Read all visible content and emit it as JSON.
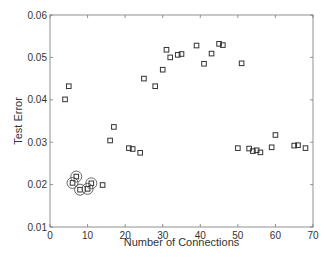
{
  "chart_data": {
    "type": "scatter",
    "title": "",
    "xlabel": "Number of Connections",
    "ylabel": "Test Error",
    "xlim": [
      0,
      70
    ],
    "ylim": [
      0.01,
      0.06
    ],
    "x_ticks": [
      0,
      10,
      20,
      30,
      40,
      50,
      60,
      70
    ],
    "y_ticks": [
      0.01,
      0.02,
      0.03,
      0.04,
      0.05,
      0.06
    ],
    "x_tick_labels": [
      "0",
      "10",
      "20",
      "30",
      "40",
      "50",
      "60",
      "70"
    ],
    "y_tick_labels": [
      "0.01",
      "0.02",
      "0.03",
      "0.04",
      "0.05",
      "0.06"
    ],
    "grid": false,
    "legend": null,
    "marker": "square",
    "series": [
      {
        "name": "networks",
        "points": [
          {
            "x": 4,
            "y": 0.0401
          },
          {
            "x": 5,
            "y": 0.0432
          },
          {
            "x": 6,
            "y": 0.0204,
            "circled": true
          },
          {
            "x": 7,
            "y": 0.0219,
            "circled": true
          },
          {
            "x": 8,
            "y": 0.0188,
            "circled": true
          },
          {
            "x": 10,
            "y": 0.019,
            "circled": true
          },
          {
            "x": 11,
            "y": 0.0203,
            "circled": true
          },
          {
            "x": 14,
            "y": 0.0199
          },
          {
            "x": 16,
            "y": 0.0304
          },
          {
            "x": 17,
            "y": 0.0336
          },
          {
            "x": 21,
            "y": 0.0286
          },
          {
            "x": 22,
            "y": 0.0284
          },
          {
            "x": 24,
            "y": 0.0275
          },
          {
            "x": 25,
            "y": 0.045
          },
          {
            "x": 28,
            "y": 0.0432
          },
          {
            "x": 30,
            "y": 0.0471
          },
          {
            "x": 31,
            "y": 0.0518
          },
          {
            "x": 32,
            "y": 0.05
          },
          {
            "x": 34,
            "y": 0.0506
          },
          {
            "x": 35,
            "y": 0.0508
          },
          {
            "x": 39,
            "y": 0.0528
          },
          {
            "x": 41,
            "y": 0.0485
          },
          {
            "x": 43,
            "y": 0.0509
          },
          {
            "x": 45,
            "y": 0.0532
          },
          {
            "x": 46,
            "y": 0.0529
          },
          {
            "x": 50,
            "y": 0.0286
          },
          {
            "x": 51,
            "y": 0.0486
          },
          {
            "x": 53,
            "y": 0.0285
          },
          {
            "x": 54,
            "y": 0.0279
          },
          {
            "x": 55,
            "y": 0.0281
          },
          {
            "x": 56,
            "y": 0.0276
          },
          {
            "x": 59,
            "y": 0.0288
          },
          {
            "x": 60,
            "y": 0.0317
          },
          {
            "x": 65,
            "y": 0.0292
          },
          {
            "x": 66,
            "y": 0.0293
          },
          {
            "x": 68,
            "y": 0.0286
          }
        ]
      }
    ]
  },
  "layout": {
    "plot_left": 50,
    "plot_right": 313,
    "plot_top": 15,
    "plot_bottom": 227
  }
}
